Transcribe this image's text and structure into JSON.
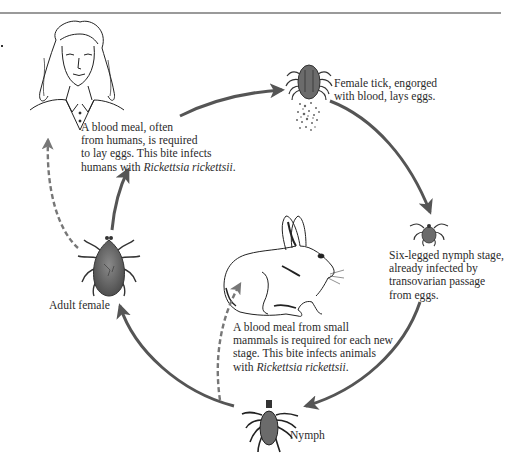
{
  "diagram": {
    "stages": [
      {
        "id": "human",
        "icon": "human-woman-illustration"
      },
      {
        "id": "engorged-female",
        "icon": "engorged-tick-laying-eggs-icon"
      },
      {
        "id": "six-legged-nymph",
        "icon": "six-legged-larva-tick-icon"
      },
      {
        "id": "nymph",
        "icon": "nymph-tick-icon"
      },
      {
        "id": "adult-female",
        "icon": "adult-female-tick-icon"
      },
      {
        "id": "small-mammal",
        "icon": "rabbit-illustration"
      }
    ],
    "captions": {
      "human_meal": {
        "lines": [
          "A blood meal, often",
          "from humans, is required",
          "to lay eggs. This bite infects"
        ],
        "last_prefix": "humans with ",
        "last_italic": "Rickettsia rickettsii",
        "last_suffix": "."
      },
      "engorged": {
        "lines": [
          "Female tick, engorged",
          "with blood, lays eggs."
        ]
      },
      "six_legged": {
        "lines": [
          "Six-legged nymph stage,",
          "already infected by",
          "transovarian passage",
          "from eggs."
        ]
      },
      "mammal_meal": {
        "lines": [
          "A blood meal from small",
          "mammals is required for each new",
          "stage. This bite infects animals"
        ],
        "last_prefix": "with ",
        "last_italic": "Rickettsia rickettsii",
        "last_suffix": "."
      }
    },
    "labels": {
      "adult_female": "Adult female",
      "nymph": "Nymph"
    },
    "arrows": [
      {
        "from": "adult-female",
        "to": "human",
        "style": "solid",
        "meaning": "blood meal"
      },
      {
        "from": "human",
        "to": "engorged-female",
        "style": "solid"
      },
      {
        "from": "engorged-female",
        "to": "six-legged-nymph",
        "style": "solid"
      },
      {
        "from": "six-legged-nymph",
        "to": "nymph",
        "style": "solid"
      },
      {
        "from": "nymph",
        "to": "adult-female",
        "style": "solid"
      },
      {
        "from": "adult-female",
        "to": "human",
        "style": "dashed",
        "meaning": "infection"
      },
      {
        "from": "nymph",
        "to": "small-mammal",
        "style": "dashed",
        "meaning": "infection"
      }
    ],
    "colors": {
      "arrow": "#555555",
      "tick_body": "#6b6b6b",
      "text": "#2b2b2b",
      "rule": "#9a9a9a"
    }
  }
}
